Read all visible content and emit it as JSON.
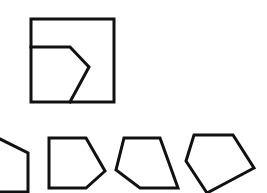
{
  "canvas": {
    "width": 267,
    "height": 193,
    "background": "#ffffff",
    "stroke_color": "#111111",
    "stroke_width": 3
  },
  "question_figure": {
    "square": {
      "x": 31,
      "y": 19,
      "width": 83,
      "height": 83
    },
    "inner_cut": "31,47 70,47 89,67 70,102"
  },
  "options": [
    {
      "label": "option-1",
      "points": "-2,138 28,153 28,192 -2,192"
    },
    {
      "label": "option-2",
      "points": "49,138 86,138 105,171 86,188 49,188"
    },
    {
      "label": "option-3",
      "points": "124,138 160,138 178,188 140,188 116,170"
    },
    {
      "label": "option-4",
      "points": "194,135 233,135 254,168 207,193 186,161"
    }
  ]
}
